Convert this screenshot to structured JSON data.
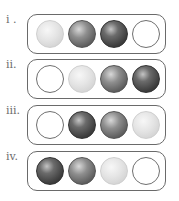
{
  "top_text": "— — — — — — — —",
  "ball_types": {
    "light": {
      "color": "#e0e0e0"
    },
    "medium": {
      "color": "#7a7a7a"
    },
    "dark": {
      "color": "#4a4a4a"
    },
    "empty": {
      "color": "#ffffff"
    }
  },
  "rows": [
    {
      "label": "i .",
      "balls": [
        "light",
        "medium",
        "dark",
        "empty"
      ]
    },
    {
      "label": "ii.",
      "balls": [
        "empty",
        "light",
        "medium",
        "dark"
      ]
    },
    {
      "label": "iii.",
      "balls": [
        "empty",
        "dark",
        "medium",
        "light"
      ]
    },
    {
      "label": "iv.",
      "balls": [
        "dark",
        "medium",
        "light",
        "empty"
      ]
    }
  ]
}
